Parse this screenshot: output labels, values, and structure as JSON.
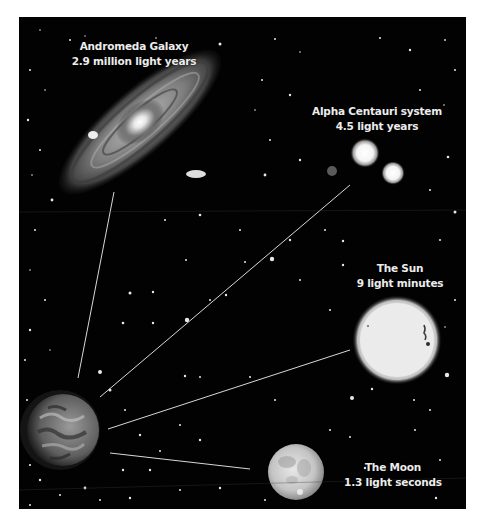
{
  "figure": {
    "background_color": "#020202",
    "line_color": "#d8d8d8",
    "objects": [
      {
        "id": "andromeda",
        "name": "Andromeda Galaxy",
        "distance": "2.9 million light years",
        "icon": "galaxy-icon"
      },
      {
        "id": "alpha-centauri",
        "name": "Alpha Centauri system",
        "distance": "4.5 light years",
        "icon": "star-system-icon"
      },
      {
        "id": "sun",
        "name": "The Sun",
        "distance": "9 light minutes",
        "icon": "sun-icon"
      },
      {
        "id": "moon",
        "name": "The Moon",
        "distance": "1.3 light seconds",
        "icon": "moon-icon"
      }
    ],
    "origin": {
      "id": "earth",
      "icon": "earth-icon"
    }
  }
}
